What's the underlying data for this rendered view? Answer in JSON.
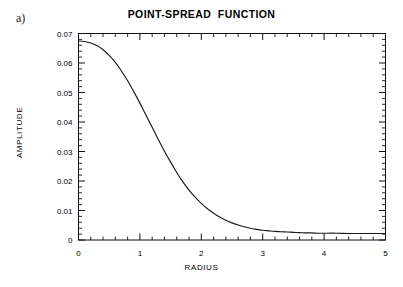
{
  "figure": {
    "panel_label": "a)",
    "title": "POINT-SPREAD  FUNCTION",
    "background_color": "#ffffff",
    "line_color": "#1a1a1a",
    "axis_color": "#000000"
  },
  "axes": {
    "xlabel": "RADIUS",
    "ylabel": "AMPLITUDE",
    "x_tick_labels": [
      "0",
      "1",
      "2",
      "3",
      "4",
      "5"
    ],
    "y_tick_labels": [
      "0",
      "0.01",
      "0.02",
      "0.03",
      "0.04",
      "0.05",
      "0.06",
      "0.07"
    ]
  },
  "chart_data": {
    "type": "line",
    "title": "POINT-SPREAD  FUNCTION",
    "xlabel": "RADIUS",
    "ylabel": "AMPLITUDE",
    "xlim": [
      0,
      5
    ],
    "ylim": [
      0,
      0.07
    ],
    "x_major_ticks": [
      0,
      1,
      2,
      3,
      4,
      5
    ],
    "x_minor_tick_step": 0.2,
    "y_major_ticks": [
      0,
      0.01,
      0.02,
      0.03,
      0.04,
      0.05,
      0.06,
      0.07
    ],
    "y_minor_tick_step": 0.002,
    "grid": false,
    "legend": false,
    "frame": "box-all-sides-inward-ticks",
    "series": [
      {
        "name": "point-spread function",
        "x": [
          0.0,
          0.1,
          0.2,
          0.3,
          0.4,
          0.5,
          0.6,
          0.7,
          0.8,
          0.9,
          1.0,
          1.1,
          1.2,
          1.3,
          1.4,
          1.5,
          1.6,
          1.7,
          1.8,
          1.9,
          2.0,
          2.1,
          2.2,
          2.3,
          2.4,
          2.5,
          2.6,
          2.7,
          2.8,
          2.9,
          3.0,
          3.1,
          3.2,
          3.3,
          3.4,
          3.5,
          3.6,
          3.7,
          3.8,
          3.9,
          4.0,
          4.2,
          4.4,
          4.6,
          4.8,
          5.0
        ],
        "y": [
          0.0675,
          0.0673,
          0.0668,
          0.0659,
          0.0645,
          0.0626,
          0.0602,
          0.0573,
          0.054,
          0.0503,
          0.0464,
          0.0423,
          0.0382,
          0.0341,
          0.0301,
          0.0264,
          0.0229,
          0.0197,
          0.0169,
          0.0145,
          0.0124,
          0.0106,
          0.0091,
          0.0078,
          0.0067,
          0.0058,
          0.0051,
          0.0045,
          0.004,
          0.0036,
          0.0033,
          0.0031,
          0.0029,
          0.0028,
          0.0027,
          0.0026,
          0.0025,
          0.0024,
          0.0024,
          0.0023,
          0.0023,
          0.0023,
          0.0022,
          0.0022,
          0.0022,
          0.0022
        ]
      }
    ]
  }
}
